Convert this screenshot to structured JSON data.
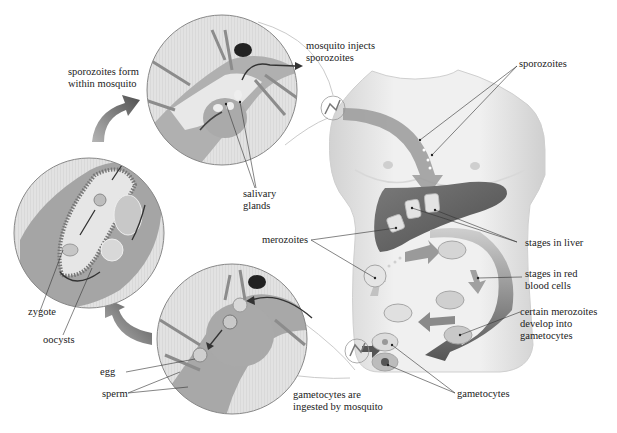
{
  "labels": {
    "sporozoites_form": "sporozoites form\nwithin mosquito",
    "mosquito_injects": "mosquito injects\nsporozoites",
    "sporozoites": "sporozoites",
    "salivary_glands": "salivary\nglands",
    "stages_in_liver": "stages in liver",
    "merozoites": "merozoites",
    "stages_in_rbc": "stages in red\nblood cells",
    "certain_merozoites": "certain merozoites\ndevelop into\ngametocytes",
    "zygote": "zygote",
    "oocysts": "oocysts",
    "egg": "egg",
    "sperm": "sperm",
    "gametocytes_ingested": "gametocytes are\ningested by mosquito",
    "gametocytes": "gametocytes"
  },
  "palette": {
    "body_light": "#eeeeee",
    "body_mid": "#d6d6d6",
    "liver": "#6e6e6e",
    "arrow": "#8a8a8a",
    "arrow_dark": "#555555",
    "circle_bg": "#e4e4e4",
    "mosquito": "#a9a9a9",
    "leader": "#333333"
  }
}
